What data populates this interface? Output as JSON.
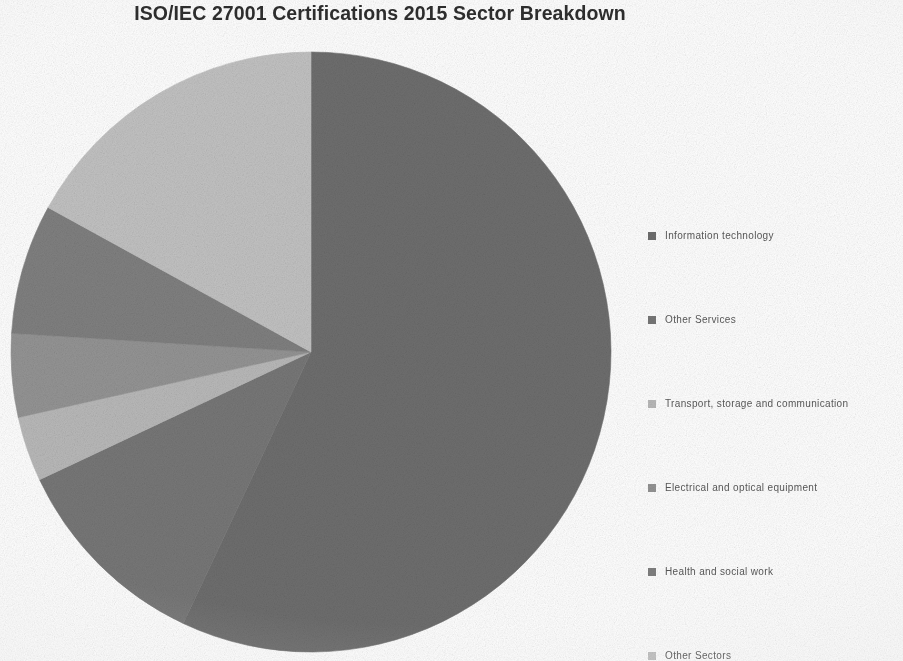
{
  "chart_data": {
    "type": "pie",
    "title": "ISO/IEC 27001 Certifications 2015 Sector Breakdown",
    "xlabel": "",
    "ylabel": "",
    "legend_position": "right",
    "grid": false,
    "categories": [
      "Information technology",
      "Other Services",
      "Transport, storage and communication",
      "Electrical and optical equipment",
      "Health and social work",
      "Other Sectors"
    ],
    "values": [
      57,
      11,
      3.5,
      4.5,
      7,
      17
    ],
    "units": "percent",
    "colors": [
      "#6e6e6e",
      "#777777",
      "#b9b9b9",
      "#949494",
      "#808080",
      "#c2c2c2"
    ],
    "slices": [
      {
        "label": "Information technology",
        "value": 57,
        "color": "#6e6e6e",
        "start_angle": 0,
        "end_angle": 205.2
      },
      {
        "label": "Other Services",
        "value": 11,
        "color": "#777777",
        "start_angle": 205.2,
        "end_angle": 244.8
      },
      {
        "label": "Transport, storage and communication",
        "value": 3.5,
        "color": "#b9b9b9",
        "start_angle": 244.8,
        "end_angle": 257.4
      },
      {
        "label": "Electrical and optical equipment",
        "value": 4.5,
        "color": "#949494",
        "start_angle": 257.4,
        "end_angle": 273.6
      },
      {
        "label": "Health and social work",
        "value": 7,
        "color": "#808080",
        "start_angle": 273.6,
        "end_angle": 298.8
      },
      {
        "label": "Other Sectors",
        "value": 17,
        "color": "#c2c2c2",
        "start_angle": 298.8,
        "end_angle": 360
      }
    ]
  },
  "legend": {
    "items": [
      {
        "label": "Information technology",
        "color": "#6e6e6e"
      },
      {
        "label": "Other Services",
        "color": "#777777"
      },
      {
        "label": "Transport, storage and communication",
        "color": "#b9b9b9"
      },
      {
        "label": "Electrical and optical equipment",
        "color": "#949494"
      },
      {
        "label": "Health and social work",
        "color": "#808080"
      },
      {
        "label": "Other Sectors",
        "color": "#c2c2c2"
      }
    ]
  },
  "geometry": {
    "center_x": 301,
    "center_y": 301,
    "radius": 300
  }
}
